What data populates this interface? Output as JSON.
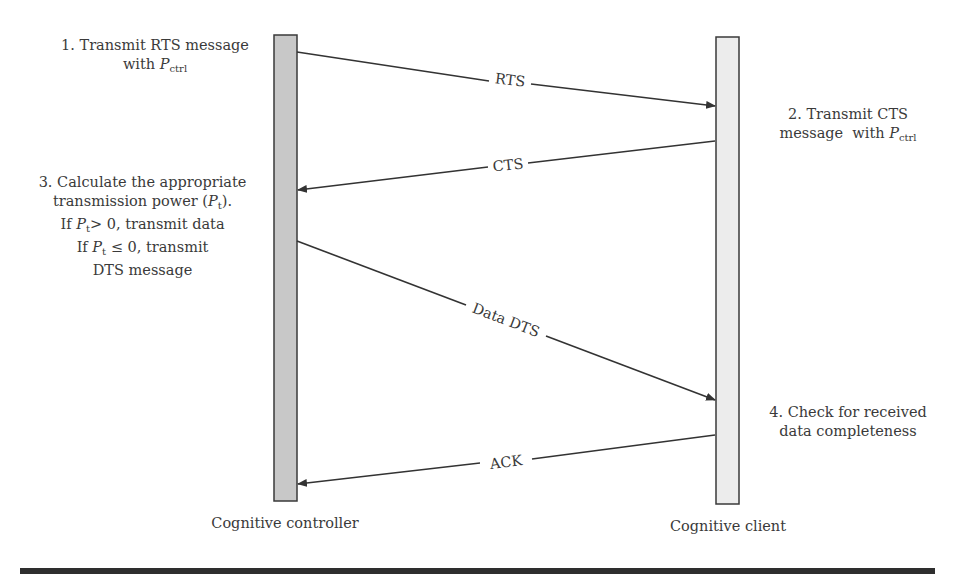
{
  "diagram": {
    "type": "sequence",
    "colors": {
      "controller_bar": "#c8c8c8",
      "client_bar": "#ececec",
      "bar_stroke": "#3a3a3a",
      "arrow": "#333333",
      "text": "#3a3a3a",
      "rule": "#2e2e2e"
    },
    "participants": [
      {
        "id": "controller",
        "label": "Cognitive controller"
      },
      {
        "id": "client",
        "label": "Cognitive client"
      }
    ],
    "messages": [
      {
        "label": "RTS",
        "from": "controller",
        "to": "client"
      },
      {
        "label": "CTS",
        "from": "client",
        "to": "controller"
      },
      {
        "label": "Data DTS",
        "from": "controller",
        "to": "client"
      },
      {
        "label": "ACK",
        "from": "client",
        "to": "controller"
      }
    ],
    "notes": {
      "step1": {
        "line1": "1. Transmit RTS message",
        "line2_prefix": "with ",
        "var": "P",
        "sub": "ctrl"
      },
      "step2": {
        "line1": "2. Transmit CTS",
        "line2_prefix": "message  with ",
        "var": "P",
        "sub": "ctrl"
      },
      "step3": {
        "line1": "3. Calculate the appropriate",
        "line2_prefix": "transmission power (",
        "line2_var": "P",
        "line2_sub": "t",
        "line2_suffix": ").",
        "line3_prefix": "If ",
        "line3_var": "P",
        "line3_sub": "t",
        "line3_suffix": "> 0, transmit data",
        "line4_prefix": "If ",
        "line4_var": "P",
        "line4_sub": "t",
        "line4_suffix": " ≤ 0, transmit",
        "line5": "DTS message"
      },
      "step4": {
        "line1": "4. Check for received",
        "line2": "data completeness"
      }
    }
  }
}
